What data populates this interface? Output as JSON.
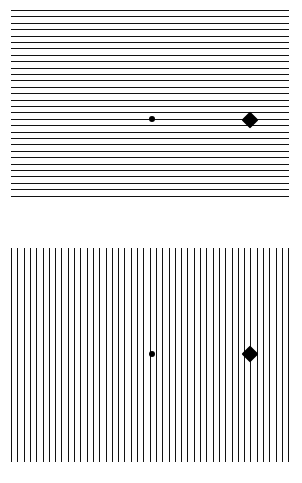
{
  "figure": {
    "width": 302,
    "height": 483,
    "background_color": "#ffffff",
    "ink_color": "#121212",
    "target_color": "#000000"
  },
  "panels": [
    {
      "id": "panel-horizontal",
      "label": "Top panel — horizontal grating",
      "grating": {
        "orientation": "horizontal",
        "line_count": 30,
        "line_thickness_px": 1,
        "spacing_px": 6.4,
        "extent_left_px": 11,
        "extent_right_px": 289,
        "extent_top_px": 10,
        "extent_bottom_px": 231,
        "color": "#121212"
      },
      "targets": [
        {
          "id": "small-dot",
          "shape": "circle",
          "label": "small dot target",
          "center_x_px": 152,
          "center_y_px": 119,
          "size_px": 6,
          "color": "#000000"
        },
        {
          "id": "large-diamond",
          "shape": "diamond",
          "label": "large diamond target",
          "center_x_px": 250,
          "center_y_px": 120,
          "size_px": 17,
          "color": "#000000"
        }
      ]
    },
    {
      "id": "panel-vertical",
      "label": "Bottom panel — vertical grating",
      "grating": {
        "orientation": "vertical",
        "line_count": 45,
        "line_thickness_px": 1,
        "spacing_px": 6.3,
        "extent_left_px": 11,
        "extent_right_px": 289,
        "extent_top_px": 248,
        "extent_bottom_px": 462,
        "color": "#121212"
      },
      "targets": [
        {
          "id": "small-dot",
          "shape": "circle",
          "label": "small dot target",
          "center_x_px": 152,
          "center_y_px": 354,
          "size_px": 6,
          "color": "#000000"
        },
        {
          "id": "large-diamond",
          "shape": "diamond",
          "label": "large diamond target",
          "center_x_px": 250,
          "center_y_px": 354,
          "size_px": 17,
          "color": "#000000"
        }
      ]
    }
  ]
}
